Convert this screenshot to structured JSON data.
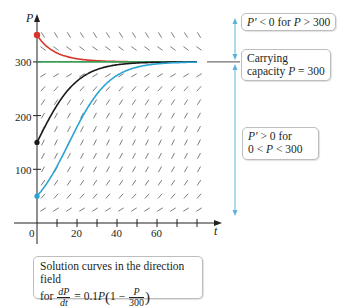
{
  "chart_data": {
    "type": "line",
    "xlabel": "t",
    "ylabel": "P",
    "xlim": [
      0,
      90
    ],
    "ylim": [
      0,
      380
    ],
    "x_ticks": [
      0,
      10,
      20,
      30,
      40,
      50,
      60,
      70,
      80
    ],
    "x_tick_labels": [
      {
        "value": 0,
        "label": "0"
      },
      {
        "value": 20,
        "label": "20"
      },
      {
        "value": 40,
        "label": "40"
      },
      {
        "value": 60,
        "label": "60"
      }
    ],
    "y_ticks": [
      100,
      200,
      300
    ],
    "y_tick_labels": [
      "100",
      "200",
      "300"
    ],
    "grid": false,
    "equation": {
      "r": 0.1,
      "K": 300
    },
    "carrying_capacity": 300,
    "series": [
      {
        "name": "P(0)=350",
        "initial": 350,
        "color": "#d9362b",
        "points": [
          [
            0,
            350
          ],
          [
            10,
            314
          ],
          [
            20,
            304
          ],
          [
            30,
            301
          ],
          [
            40,
            300
          ],
          [
            60,
            300
          ],
          [
            80,
            300
          ]
        ]
      },
      {
        "name": "P(0)=300 (equilibrium)",
        "initial": 300,
        "color": "#3f9b55",
        "points": [
          [
            0,
            300
          ],
          [
            80,
            300
          ]
        ]
      },
      {
        "name": "P(0)=150",
        "initial": 150,
        "color": "#1a1a1a",
        "points": [
          [
            0,
            150
          ],
          [
            10,
            219
          ],
          [
            20,
            265
          ],
          [
            30,
            286
          ],
          [
            40,
            295
          ],
          [
            60,
            299
          ],
          [
            80,
            300
          ]
        ]
      },
      {
        "name": "P(0)=50",
        "initial": 50,
        "color": "#2ba3d3",
        "points": [
          [
            0,
            50
          ],
          [
            10,
            105
          ],
          [
            20,
            178
          ],
          [
            30,
            240
          ],
          [
            40,
            276
          ],
          [
            50,
            291
          ],
          [
            60,
            297
          ],
          [
            80,
            300
          ]
        ]
      }
    ]
  },
  "axes": {
    "y_label": "P",
    "x_label": "t",
    "x_tick_labels": [
      "0",
      "20",
      "40",
      "60"
    ],
    "y_tick_labels": [
      "100",
      "200",
      "300"
    ]
  },
  "annotations": {
    "negative": {
      "prefix": "P′",
      "text": " < 0 for ",
      "var": "P",
      "rest": " > 300"
    },
    "capacity": {
      "line1": "Carrying",
      "line2_prefix": "capacity ",
      "var": "P",
      "line2_rest": " = 300"
    },
    "positive": {
      "line1_var": "P′",
      "line1_rest": " > 0 for",
      "line2_a": "0 < ",
      "line2_var": "P",
      "line2_b": " < 300"
    }
  },
  "caption": {
    "line1": "Solution curves in the direction field",
    "for": "for ",
    "dP": "dP",
    "dt": "dt",
    "eq": " = 0.1",
    "P": "P",
    "one_minus": "1 − ",
    "num": "P",
    "den": "300"
  },
  "colors": {
    "red": "#d9362b",
    "green": "#3f9b55",
    "black": "#1a1a1a",
    "blue": "#2ba3d3",
    "field": "#6d6e71",
    "axis": "#231f20",
    "arrow_blue": "#5fb3d9"
  }
}
